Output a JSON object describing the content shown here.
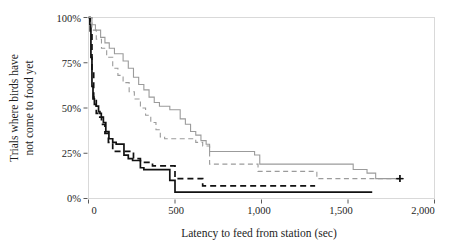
{
  "figure": {
    "background_color": "#ffffff",
    "frame_color": "#d9d9d9"
  },
  "axes": {
    "x_title": "Latency to feed from station (sec)",
    "y_title_line1": "Trials where birds have",
    "y_title_line2": "not come to food yet",
    "x_ticks": [
      "0",
      "500",
      "1,000",
      "1,500",
      "2,000"
    ],
    "y_ticks": [
      "100%",
      "75%",
      "50%",
      "25%",
      "0%"
    ]
  },
  "chart_data": {
    "type": "line",
    "title": "",
    "subtitle": "",
    "xlabel": "Latency to feed from station (sec)",
    "ylabel": "Trials where birds have not come to food yet",
    "xlim": [
      0,
      2000
    ],
    "ylim": [
      0,
      100
    ],
    "xticks": [
      0,
      500,
      1000,
      1500,
      2000
    ],
    "xticklabels": [
      "0",
      "500",
      "1,000",
      "1,500",
      "2,000"
    ],
    "yticks": [
      0,
      25,
      50,
      75,
      100
    ],
    "yticklabels": [
      "0%",
      "25%",
      "50%",
      "75%",
      "100%"
    ],
    "grid": false,
    "legend": "none",
    "step_type": "post",
    "series": [
      {
        "name": "solid-dark",
        "style": "solid",
        "color": "#111111",
        "linewidth": 1.7,
        "x": [
          0,
          8,
          14,
          20,
          26,
          34,
          44,
          58,
          66,
          74,
          86,
          100,
          118,
          140,
          160,
          180,
          205,
          230,
          255,
          275,
          300,
          320,
          345,
          380,
          420,
          470,
          485,
          500,
          1640
        ],
        "y": [
          100,
          96,
          78,
          62,
          55,
          52,
          51,
          48,
          47,
          45,
          42,
          37,
          33,
          31,
          30,
          30,
          24,
          22,
          21,
          21,
          17,
          16,
          16,
          16,
          16,
          10,
          10,
          3.5,
          3.5
        ],
        "censor_x": [],
        "censor_y": []
      },
      {
        "name": "dashed-dark",
        "style": "dashed",
        "color": "#111111",
        "linewidth": 1.7,
        "x": [
          0,
          10,
          20,
          30,
          45,
          60,
          75,
          95,
          115,
          140,
          175,
          210,
          260,
          300,
          330,
          370,
          420,
          460,
          500,
          640,
          660,
          1310
        ],
        "y": [
          100,
          92,
          70,
          56,
          47,
          45,
          41,
          36,
          31,
          26,
          26,
          26,
          22,
          20,
          20,
          18,
          18,
          18,
          11,
          11,
          7,
          7
        ],
        "censor_x": [],
        "censor_y": []
      },
      {
        "name": "solid-light",
        "style": "solid",
        "color": "#9b9b9b",
        "linewidth": 1.1,
        "x": [
          0,
          20,
          40,
          70,
          95,
          120,
          150,
          175,
          200,
          230,
          260,
          290,
          320,
          350,
          380,
          410,
          440,
          470,
          500,
          530,
          560,
          590,
          620,
          650,
          680,
          700,
          790,
          960,
          990,
          1270,
          1450,
          1530,
          1610,
          1660,
          1800
        ],
        "y": [
          100,
          96,
          93,
          89,
          86,
          83,
          80,
          80,
          76,
          72,
          67,
          63,
          60,
          56,
          53,
          51,
          51,
          49,
          49,
          44,
          41,
          37,
          35,
          32,
          30,
          26,
          26,
          24,
          19,
          19,
          19,
          16,
          14,
          11,
          11
        ],
        "censor_x": [
          1800
        ],
        "censor_y": [
          11
        ]
      },
      {
        "name": "dashed-light",
        "style": "dashed",
        "color": "#9b9b9b",
        "linewidth": 1.1,
        "x": [
          0,
          20,
          45,
          75,
          105,
          140,
          170,
          200,
          235,
          265,
          300,
          330,
          360,
          390,
          415,
          440,
          470,
          500,
          530,
          570,
          620,
          660,
          700,
          940,
          980,
          1250,
          1320,
          1800
        ],
        "y": [
          100,
          93,
          88,
          83,
          78,
          72,
          68,
          64,
          59,
          55,
          50,
          46,
          42,
          38,
          34,
          33,
          33,
          33,
          33,
          33,
          31,
          29,
          19,
          19,
          15,
          15,
          11,
          11
        ],
        "censor_x": [
          1800
        ],
        "censor_y": [
          11
        ]
      }
    ]
  }
}
